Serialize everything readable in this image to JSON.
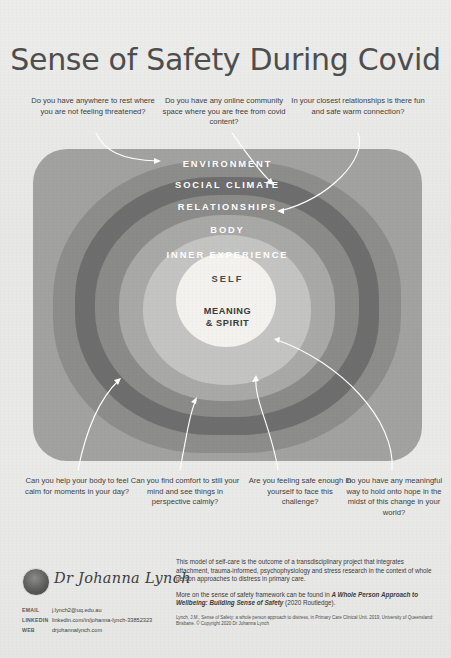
{
  "poster": {
    "title": "Sense of Safety During Covid",
    "background_color": "#e9e9e7"
  },
  "questions": {
    "top": [
      {
        "id": "environment",
        "text": "Do you have anywhere to rest where you are not feeling threatened?"
      },
      {
        "id": "social-climate",
        "text": "Do you have any online community space where you are free from covid content?"
      },
      {
        "id": "relationships",
        "text": "In your closest relationships is there fun and safe warm connection?"
      }
    ],
    "bottom": [
      {
        "id": "body",
        "text": "Can you help your body to feel calm for moments in your day?"
      },
      {
        "id": "inner-experience",
        "text": "Can you find comfort to still your mind and see things in perspective calmly?"
      },
      {
        "id": "self",
        "text": "Are you feeling safe enough in yourself to face this challenge?"
      },
      {
        "id": "meaning-spirit",
        "text": "Do you have any meaningful way to hold onto hope in the midst of this change in your world?"
      }
    ]
  },
  "rings": [
    {
      "id": "environment",
      "label": "ENVIRONMENT",
      "color": "#a2a2a1",
      "text_color": "#ffffff"
    },
    {
      "id": "social-climate",
      "label": "SOCIAL CLIMATE",
      "color": "#8d8d8c",
      "text_color": "#ffffff"
    },
    {
      "id": "relationships",
      "label": "RELATIONSHIPS",
      "color": "#6e6e6e",
      "text_color": "#ffffff"
    },
    {
      "id": "body",
      "label": "BODY",
      "color": "#8b8b8a",
      "text_color": "#ffffff"
    },
    {
      "id": "inner-experience",
      "label": "INNER EXPERIENCE",
      "color": "#a9a9a8",
      "text_color": "#ffffff"
    },
    {
      "id": "self",
      "label": "SELF",
      "color": "#c4c4c3",
      "text_color": "#4a4a4a"
    },
    {
      "id": "meaning-spirit",
      "label": "MEANING & SPIRIT",
      "color": "#f3f2ee",
      "text_color": "#3a3a3a"
    }
  ],
  "core_label_line1": "MEANING",
  "core_label_line2": "& SPIRIT",
  "footer": {
    "author_name": "Dr Johanna Lynch",
    "contacts": [
      {
        "key": "EMAIL",
        "value": "j.lynch2@uq.edu.au"
      },
      {
        "key": "LINKEDIN",
        "value": "linkedin.com/in/johanna-lynch-33852323"
      },
      {
        "key": "WEB",
        "value": "drjohannalynch.com"
      }
    ],
    "paragraph1": "This model of self-care is the outcome of a transdisciplinary project that integrates attachment, trauma-informed, psychophysiology and stress research in the context of whole person approaches to distress in primary care.",
    "paragraph2_pre": "More on the sense of safety framework can be found in ",
    "paragraph2_italic": "A Whole Person Approach to Wellbeing: Building Sense of Safety",
    "paragraph2_post": " (2020 Routledge).",
    "citation": "Lynch, J.M., Sense of Safety: a whole person approach to distress, in Primary Care Clinical Unit. 2019, University of Queensland: Brisbane. © Copyright 2020 Dr Johanna Lynch"
  }
}
